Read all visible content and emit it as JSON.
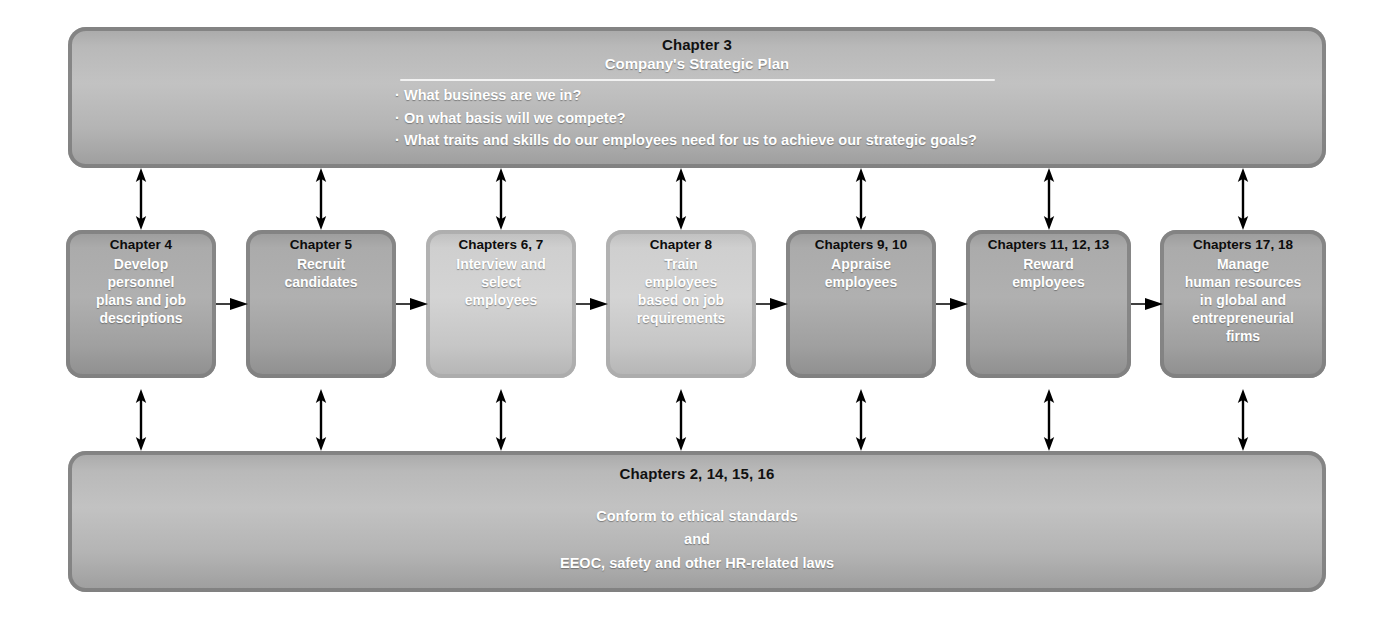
{
  "diagram": {
    "top_panel": {
      "chapter": "Chapter 3",
      "title": "Company's Strategic Plan",
      "bullets": [
        "What business are we in?",
        "On what basis will we compete?",
        "What traits and skills do our employees need for us to achieve our strategic goals?"
      ]
    },
    "bottom_panel": {
      "chapter": "Chapters 2, 14, 15, 16",
      "lines": [
        "Conform to ethical standards",
        "and",
        "EEOC, safety and other HR-related laws"
      ]
    },
    "steps": [
      {
        "chapter": "Chapter 4",
        "body": "Develop\npersonnel\nplans and job\ndescriptions",
        "shade": "dark"
      },
      {
        "chapter": "Chapter 5",
        "body": "Recruit\ncandidates",
        "shade": "dark"
      },
      {
        "chapter": "Chapters 6, 7",
        "body": "Interview and\nselect\nemployees",
        "shade": "light"
      },
      {
        "chapter": "Chapter 8",
        "body": "Train\nemployees\nbased on job\nrequirements",
        "shade": "light"
      },
      {
        "chapter": "Chapters 9, 10",
        "body": "Appraise\nemployees",
        "shade": "dark"
      },
      {
        "chapter": "Chapters 11, 12, 13",
        "body": "Reward\nemployees",
        "shade": "dark"
      },
      {
        "chapter": "Chapters 17, 18",
        "body": "Manage\nhuman resources\nin global and\nentrepreneurial\nfirms",
        "shade": "dark"
      }
    ],
    "colors": {
      "panel_fill": "#b8b8b8",
      "box_dark": "#a5a5a5",
      "box_light": "#cccccc",
      "arrow": "#000000",
      "chapter_text": "#0d0d0d",
      "body_text": "#ffffff"
    }
  }
}
